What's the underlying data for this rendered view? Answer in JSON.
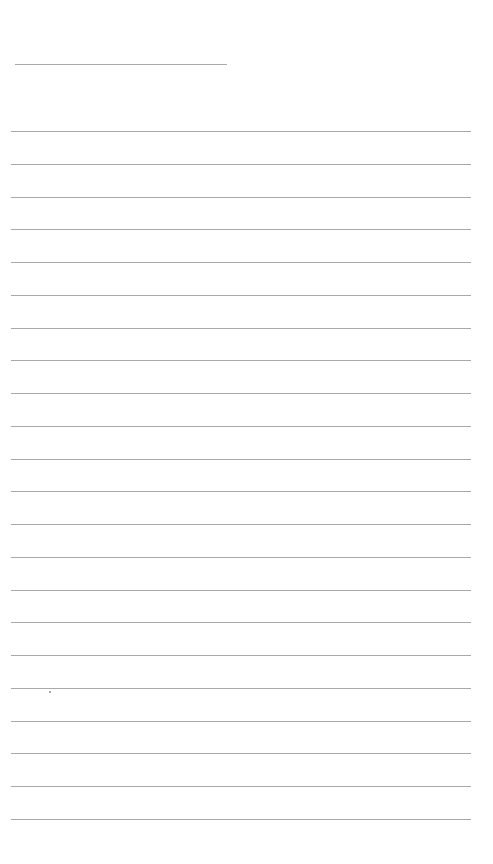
{
  "page": {
    "type": "lined-paper",
    "background_color": "#ffffff",
    "line_color": "#a9a9a9",
    "header_line": {
      "x": 15,
      "y": 64,
      "width": 212
    },
    "rules": {
      "count": 22,
      "first_y": 131,
      "spacing": 32.75,
      "x_start": 11,
      "x_end": 471
    },
    "marks": [
      {
        "type": "speck",
        "x": 49,
        "y": 691
      }
    ]
  }
}
